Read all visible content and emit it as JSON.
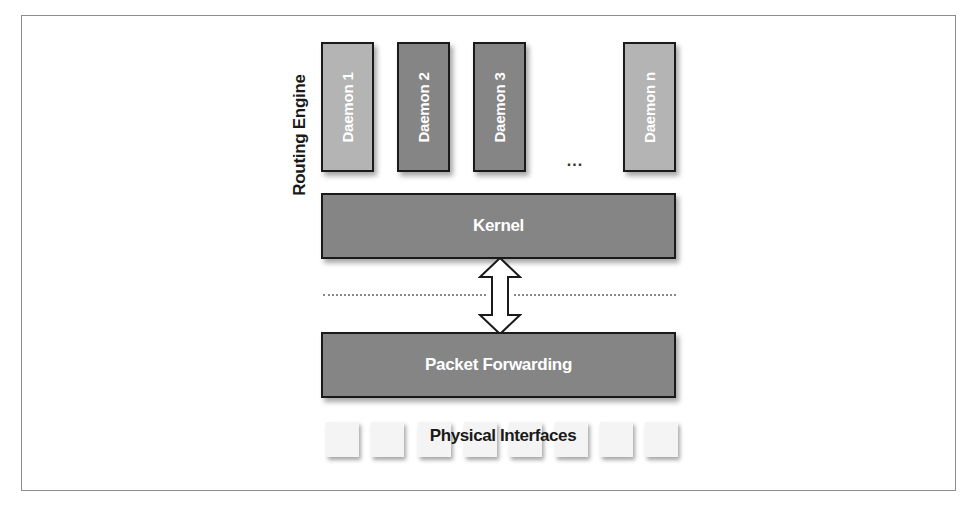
{
  "diagram": {
    "side_label": "Routing Engine",
    "daemons": [
      {
        "label": "Daemon 1",
        "shade": "light"
      },
      {
        "label": "Daemon 2",
        "shade": "dark"
      },
      {
        "label": "Daemon 3",
        "shade": "dark"
      },
      {
        "label": "Daemon n",
        "shade": "light"
      }
    ],
    "ellipsis": "...",
    "kernel": {
      "label": "Kernel"
    },
    "packet_forwarding": {
      "label": "Packet Forwarding"
    },
    "physical_interfaces": {
      "label": "Physical Interfaces",
      "count": 8
    },
    "connector": {
      "type": "bidirectional-arrow",
      "from": "Kernel",
      "to": "Packet Forwarding"
    },
    "colors": {
      "light_box": "#b4b4b4",
      "dark_box": "#858585",
      "border": "#1a1a1a",
      "text_on_box": "#ffffff",
      "frame": "#8c8c8c"
    }
  }
}
